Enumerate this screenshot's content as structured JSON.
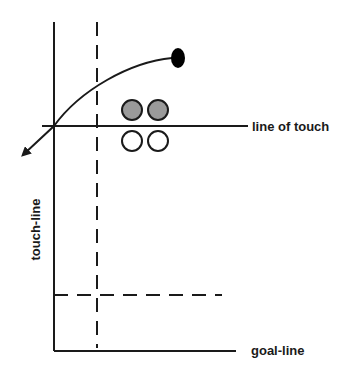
{
  "diagram": {
    "labels": {
      "line_of_touch": "line of touch",
      "touch_line": "touch-line",
      "goal_line": "goal-line"
    },
    "players": {
      "attackers_shaded": 2,
      "defenders_open": 2,
      "ball_carrier": "black oval"
    },
    "colors": {
      "line": "#1a1a1a",
      "shaded_player": "#9a9a9a",
      "open_player": "#ffffff",
      "ball": "#000000"
    }
  }
}
